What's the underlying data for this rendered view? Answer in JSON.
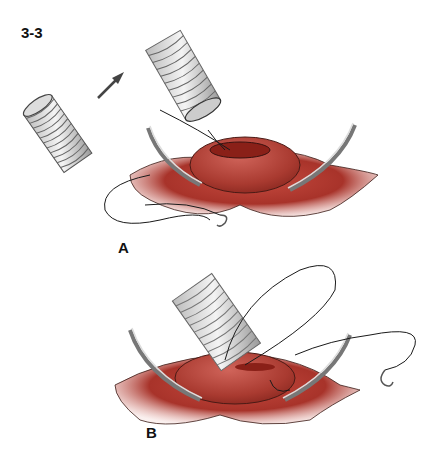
{
  "figure": {
    "number": "3-3",
    "panels": [
      {
        "label": "A",
        "description": "Tubular graft about to be sewn to a vessel opening; stay-suture needles retract tissue"
      },
      {
        "label": "B",
        "description": "Graft sewn onto vessel opening with running suture and needle"
      }
    ]
  },
  "colors": {
    "tissue": "#a8332a",
    "tissue_dark": "#7a1e18",
    "tissue_light": "#d9807a",
    "graft_stroke": "#555555",
    "suture": "#1a1a1a",
    "needle": "#888888"
  }
}
